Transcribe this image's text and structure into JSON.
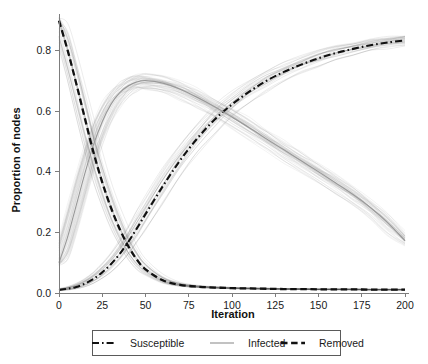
{
  "chart_data": {
    "type": "line",
    "title": "",
    "xlabel": "Iteration",
    "ylabel": "Proportion of nodes",
    "xlim": [
      0,
      200
    ],
    "ylim": [
      0.0,
      0.92
    ],
    "grid": false,
    "legend_position": "bottom",
    "xticks": [
      0,
      25,
      50,
      75,
      100,
      125,
      150,
      175,
      200
    ],
    "xtick_labels": [
      "0",
      "25",
      "50",
      "75",
      "100",
      "125",
      "150",
      "175",
      "200"
    ],
    "yticks": [
      0.0,
      0.2,
      0.4,
      0.6,
      0.8
    ],
    "ytick_labels": [
      "0.0",
      "0.2",
      "0.4",
      "0.6",
      "0.8"
    ],
    "x": [
      0,
      5,
      10,
      15,
      20,
      25,
      30,
      35,
      40,
      45,
      50,
      60,
      70,
      80,
      90,
      100,
      110,
      120,
      130,
      140,
      150,
      160,
      170,
      180,
      190,
      200
    ],
    "series": [
      {
        "name": "Susceptible",
        "style": "dash-dot",
        "color": "#111111",
        "values": [
          0.01,
          0.014,
          0.02,
          0.031,
          0.047,
          0.068,
          0.095,
          0.128,
          0.168,
          0.213,
          0.26,
          0.352,
          0.437,
          0.51,
          0.572,
          0.622,
          0.664,
          0.7,
          0.729,
          0.753,
          0.774,
          0.791,
          0.805,
          0.817,
          0.826,
          0.833
        ]
      },
      {
        "name": "Infected",
        "style": "solid",
        "color": "#9a9a9a",
        "values": [
          0.1,
          0.185,
          0.29,
          0.395,
          0.49,
          0.565,
          0.622,
          0.66,
          0.683,
          0.696,
          0.7,
          0.692,
          0.672,
          0.645,
          0.614,
          0.58,
          0.545,
          0.508,
          0.472,
          0.436,
          0.4,
          0.363,
          0.325,
          0.282,
          0.232,
          0.172
        ]
      },
      {
        "name": "Removed",
        "style": "dashed",
        "color": "#111111",
        "values": [
          0.898,
          0.8,
          0.69,
          0.575,
          0.462,
          0.365,
          0.282,
          0.212,
          0.155,
          0.11,
          0.078,
          0.042,
          0.027,
          0.021,
          0.018,
          0.016,
          0.015,
          0.014,
          0.013,
          0.013,
          0.012,
          0.012,
          0.012,
          0.011,
          0.011,
          0.011
        ]
      }
    ]
  },
  "axes": {
    "ylabel": "Proportion of nodes",
    "xlabel": "Iteration"
  },
  "legend": {
    "items": [
      {
        "label": "Susceptible",
        "style": "dash-dot"
      },
      {
        "label": "Infected",
        "style": "solid"
      },
      {
        "label": "Removed",
        "style": "dashed"
      }
    ]
  }
}
